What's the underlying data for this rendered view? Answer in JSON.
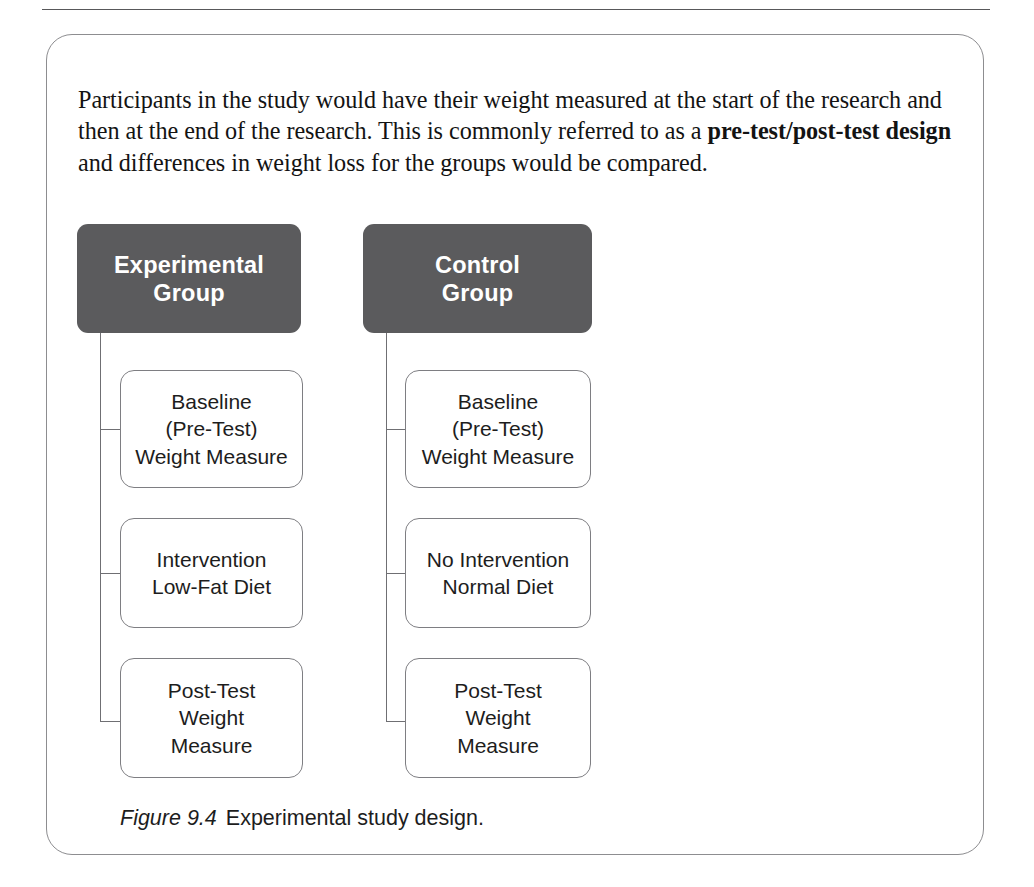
{
  "figure": {
    "intro_paragraph": {
      "part1": "Participants in the study would have their weight measured at the start of the research and then at the end of the research. This is commonly referred to as a ",
      "bold1": "pre-test/post-test design",
      "part2": " and differences in weight loss for the groups would be compared."
    },
    "caption": {
      "number": "Figure 9.4",
      "text": "Experimental study design."
    },
    "colors": {
      "header_box_fill": "#5b5b5d",
      "header_box_text": "#ffffff",
      "leaf_box_border": "#7e7e82",
      "connector_line": "#6f6f73",
      "panel_border": "#8d8d90",
      "rule": "#58585a"
    },
    "columns": [
      {
        "id": "experimental",
        "header": "Experimental\nGroup",
        "header_line1": "Experimental",
        "header_line2": "Group",
        "steps": [
          {
            "id": "baseline",
            "line1": "Baseline",
            "line2": "(Pre-Test)",
            "line3": "Weight Measure"
          },
          {
            "id": "intervention",
            "line1": "Intervention",
            "line2": "Low-Fat Diet",
            "line3": ""
          },
          {
            "id": "post-test",
            "line1": "Post-Test",
            "line2": "Weight",
            "line3": "Measure"
          }
        ]
      },
      {
        "id": "control",
        "header": "Control\nGroup",
        "header_line1": "Control",
        "header_line2": "Group",
        "steps": [
          {
            "id": "baseline",
            "line1": "Baseline",
            "line2": "(Pre-Test)",
            "line3": "Weight Measure"
          },
          {
            "id": "no-intervention",
            "line1": "No Intervention",
            "line2": "Normal Diet",
            "line3": ""
          },
          {
            "id": "post-test",
            "line1": "Post-Test",
            "line2": "Weight",
            "line3": "Measure"
          }
        ]
      }
    ]
  }
}
